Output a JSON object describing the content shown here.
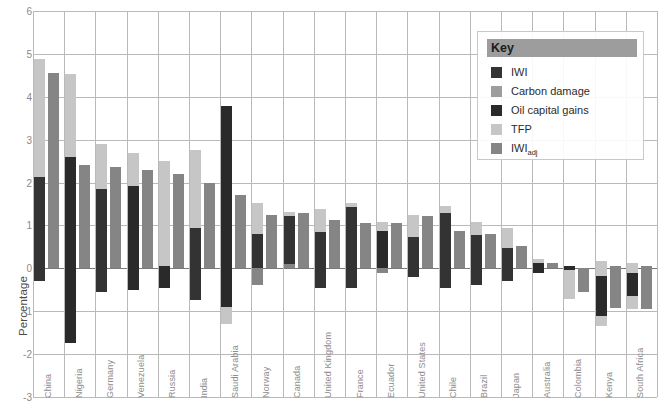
{
  "axis": {
    "y_title": "Percentage",
    "y_ticks": [
      6,
      5,
      4,
      3,
      2,
      1,
      0,
      -1,
      -2,
      -3
    ],
    "y_min": -3,
    "y_max": 6
  },
  "legend": {
    "title": "Key",
    "items": [
      {
        "label": "IWI",
        "color": "#333333"
      },
      {
        "label": "Carbon damage",
        "color": "#9d9d9d"
      },
      {
        "label": "Oil capital gains",
        "color": "#2a2a2a"
      },
      {
        "label": "TFP",
        "color": "#c6c6c6"
      },
      {
        "label": "IWI_adj",
        "label_base": "IWI",
        "label_sub": "adj",
        "color": "#858585"
      }
    ]
  },
  "chart_data": {
    "type": "bar",
    "title": "",
    "xlabel": "",
    "ylabel": "Percentage",
    "ylim": [
      -3,
      6
    ],
    "grid": true,
    "legend_position": "top-right",
    "stacked": true,
    "categories": [
      "China",
      "Nigeria",
      "Germany",
      "Venezuela",
      "Russia",
      "India",
      "Saudi Arabia",
      "Norway",
      "Canada",
      "United Kingdom",
      "France",
      "Ecuador",
      "United States",
      "Chile",
      "Brazil",
      "Japan",
      "Australia",
      "Colombia",
      "Kenya",
      "South Africa"
    ],
    "series": [
      {
        "name": "IWI",
        "color": "#333333",
        "note": "dark segment of left stacked bar, drawn from its own start to end",
        "ranges": [
          [
            -0.3,
            2.12
          ],
          [
            -1.75,
            2.6
          ],
          [
            -0.55,
            1.85
          ],
          [
            -0.5,
            1.92
          ],
          [
            -0.45,
            0.05
          ],
          [
            -0.75,
            0.95
          ],
          [
            -0.9,
            3.78
          ],
          [
            0.0,
            0.8
          ],
          [
            0.1,
            1.28
          ],
          [
            -0.45,
            0.85
          ],
          [
            -0.45,
            1.5
          ],
          [
            0.0,
            0.88
          ],
          [
            -0.2,
            0.72
          ],
          [
            -0.45,
            1.28
          ],
          [
            -0.4,
            0.78
          ],
          [
            0.0,
            0.48
          ],
          [
            -0.1,
            0.13
          ],
          [
            -0.58,
            0.0
          ],
          [
            -1.1,
            0.05
          ],
          [
            -0.65,
            0.0
          ]
        ]
      },
      {
        "name": "Carbon damage / TFP stack (left bar light)",
        "color": "#c6c6c6",
        "note": "light-gray portion of the left stacked bar",
        "ranges": [
          [
            2.12,
            4.88
          ],
          [
            2.6,
            4.52
          ],
          [
            1.85,
            2.9
          ],
          [
            1.92,
            2.68
          ],
          [
            0.05,
            2.5
          ],
          [
            0.95,
            2.75
          ],
          [
            -1.3,
            -0.9
          ],
          [
            0.8,
            1.52
          ],
          [
            1.28,
            1.3
          ],
          [
            0.85,
            1.38
          ],
          [
            1.5,
            1.52
          ],
          [
            0.88,
            1.08
          ],
          [
            0.72,
            1.25
          ],
          [
            1.28,
            1.45
          ],
          [
            0.78,
            1.08
          ],
          [
            0.48,
            0.95
          ],
          [
            0.13,
            0.2
          ],
          [
            -0.72,
            -0.58
          ],
          [
            -1.35,
            0.18
          ],
          [
            -0.95,
            0.12
          ]
        ]
      },
      {
        "name": "IWIadj",
        "color": "#858585",
        "note": "right bar of each pair",
        "values": [
          4.55,
          2.42,
          2.36,
          2.3,
          2.2,
          1.98,
          1.7,
          1.25,
          1.3,
          1.12,
          1.05,
          1.05,
          1.22,
          0.88,
          0.8,
          0.52,
          0.12,
          -0.55,
          -0.92,
          -0.95
        ]
      }
    ]
  },
  "bars": [
    {
      "name": "China",
      "left_segments": [
        {
          "c": "#c6c6c6",
          "lo": 2.12,
          "hi": 4.88
        },
        {
          "c": "#333333",
          "lo": -0.3,
          "hi": 2.12
        }
      ],
      "right": {
        "c": "#858585",
        "lo": 0,
        "hi": 4.55
      }
    },
    {
      "name": "Nigeria",
      "left_segments": [
        {
          "c": "#c6c6c6",
          "lo": 2.6,
          "hi": 4.52
        },
        {
          "c": "#2a2a2a",
          "lo": -1.75,
          "hi": 2.6
        }
      ],
      "right": {
        "c": "#858585",
        "lo": 0,
        "hi": 2.42
      }
    },
    {
      "name": "Germany",
      "left_segments": [
        {
          "c": "#c6c6c6",
          "lo": 1.85,
          "hi": 2.9
        },
        {
          "c": "#333333",
          "lo": -0.55,
          "hi": 1.85
        }
      ],
      "right": {
        "c": "#858585",
        "lo": 0,
        "hi": 2.36
      }
    },
    {
      "name": "Venezuela",
      "left_segments": [
        {
          "c": "#c6c6c6",
          "lo": 1.92,
          "hi": 2.68
        },
        {
          "c": "#2a2a2a",
          "lo": -0.5,
          "hi": 1.92
        }
      ],
      "right": {
        "c": "#858585",
        "lo": 0,
        "hi": 2.3
      }
    },
    {
      "name": "Russia",
      "left_segments": [
        {
          "c": "#c6c6c6",
          "lo": 0.05,
          "hi": 2.5
        },
        {
          "c": "#2a2a2a",
          "lo": -0.45,
          "hi": 0.05
        }
      ],
      "right": {
        "c": "#858585",
        "lo": 0,
        "hi": 2.2
      }
    },
    {
      "name": "India",
      "left_segments": [
        {
          "c": "#c6c6c6",
          "lo": 0.95,
          "hi": 2.75
        },
        {
          "c": "#333333",
          "lo": -0.75,
          "hi": 0.95
        }
      ],
      "right": {
        "c": "#858585",
        "lo": 0,
        "hi": 1.98
      }
    },
    {
      "name": "Saudi Arabia",
      "left_segments": [
        {
          "c": "#c6c6c6",
          "lo": -1.3,
          "hi": -0.9
        },
        {
          "c": "#2a2a2a",
          "lo": -0.9,
          "hi": 3.78
        }
      ],
      "right": {
        "c": "#858585",
        "lo": 0,
        "hi": 1.7
      }
    },
    {
      "name": "Norway",
      "left_segments": [
        {
          "c": "#c6c6c6",
          "lo": 0.8,
          "hi": 1.52
        },
        {
          "c": "#858585",
          "lo": -0.38,
          "hi": 0.8
        },
        {
          "c": "#333333",
          "lo": 0.0,
          "hi": 0.8
        }
      ],
      "right": {
        "c": "#858585",
        "lo": 0,
        "hi": 1.25
      }
    },
    {
      "name": "Canada",
      "left_segments": [
        {
          "c": "#c6c6c6",
          "lo": 1.22,
          "hi": 1.32
        },
        {
          "c": "#333333",
          "lo": 0.1,
          "hi": 1.22
        },
        {
          "c": "#858585",
          "lo": 0.0,
          "hi": 0.1
        }
      ],
      "right": {
        "c": "#858585",
        "lo": 0,
        "hi": 1.3
      }
    },
    {
      "name": "United Kingdom",
      "left_segments": [
        {
          "c": "#c6c6c6",
          "lo": 0.85,
          "hi": 1.38
        },
        {
          "c": "#333333",
          "lo": -0.45,
          "hi": 0.85
        }
      ],
      "right": {
        "c": "#858585",
        "lo": 0,
        "hi": 1.12
      }
    },
    {
      "name": "France",
      "left_segments": [
        {
          "c": "#c6c6c6",
          "lo": 1.42,
          "hi": 1.52
        },
        {
          "c": "#333333",
          "lo": -0.45,
          "hi": 1.42
        }
      ],
      "right": {
        "c": "#858585",
        "lo": 0,
        "hi": 1.05
      }
    },
    {
      "name": "Ecuador",
      "left_segments": [
        {
          "c": "#c6c6c6",
          "lo": 0.88,
          "hi": 1.08
        },
        {
          "c": "#2a2a2a",
          "lo": 0.0,
          "hi": 0.88
        },
        {
          "c": "#858585",
          "lo": -0.12,
          "hi": 0.0
        }
      ],
      "right": {
        "c": "#858585",
        "lo": 0,
        "hi": 1.05
      }
    },
    {
      "name": "United States",
      "left_segments": [
        {
          "c": "#c6c6c6",
          "lo": 0.72,
          "hi": 1.25
        },
        {
          "c": "#333333",
          "lo": -0.2,
          "hi": 0.72
        }
      ],
      "right": {
        "c": "#858585",
        "lo": 0,
        "hi": 1.22
      }
    },
    {
      "name": "Chile",
      "left_segments": [
        {
          "c": "#c6c6c6",
          "lo": 1.28,
          "hi": 1.45
        },
        {
          "c": "#333333",
          "lo": -0.45,
          "hi": 1.28
        }
      ],
      "right": {
        "c": "#858585",
        "lo": 0,
        "hi": 0.88
      }
    },
    {
      "name": "Brazil",
      "left_segments": [
        {
          "c": "#c6c6c6",
          "lo": 0.78,
          "hi": 1.08
        },
        {
          "c": "#333333",
          "lo": -0.4,
          "hi": 0.78
        }
      ],
      "right": {
        "c": "#858585",
        "lo": 0,
        "hi": 0.8
      }
    },
    {
      "name": "Japan",
      "left_segments": [
        {
          "c": "#c6c6c6",
          "lo": 0.48,
          "hi": 0.95
        },
        {
          "c": "#333333",
          "lo": -0.3,
          "hi": 0.48
        }
      ],
      "right": {
        "c": "#858585",
        "lo": 0,
        "hi": 0.52
      }
    },
    {
      "name": "Australia",
      "left_segments": [
        {
          "c": "#c6c6c6",
          "lo": 0.13,
          "hi": 0.22
        },
        {
          "c": "#2a2a2a",
          "lo": -0.12,
          "hi": 0.13
        }
      ],
      "right": {
        "c": "#858585",
        "lo": 0,
        "hi": 0.12
      }
    },
    {
      "name": "Colombia",
      "left_segments": [
        {
          "c": "#c6c6c6",
          "lo": -0.72,
          "hi": -0.05
        },
        {
          "c": "#2a2a2a",
          "lo": -0.05,
          "hi": 0.05
        }
      ],
      "right": {
        "c": "#858585",
        "lo": -0.55,
        "hi": 0
      }
    },
    {
      "name": "Kenya",
      "left_segments": [
        {
          "c": "#c6c6c6",
          "lo": -1.35,
          "hi": 0.18
        },
        {
          "c": "#2a2a2a",
          "lo": -1.1,
          "hi": -0.18
        }
      ],
      "right": {
        "c": "#858585",
        "lo": -0.92,
        "hi": 0.05
      }
    },
    {
      "name": "South Africa",
      "left_segments": [
        {
          "c": "#c6c6c6",
          "lo": -0.95,
          "hi": 0.12
        },
        {
          "c": "#2a2a2a",
          "lo": -0.65,
          "hi": -0.12
        }
      ],
      "right": {
        "c": "#858585",
        "lo": -0.95,
        "hi": 0.05
      }
    }
  ]
}
